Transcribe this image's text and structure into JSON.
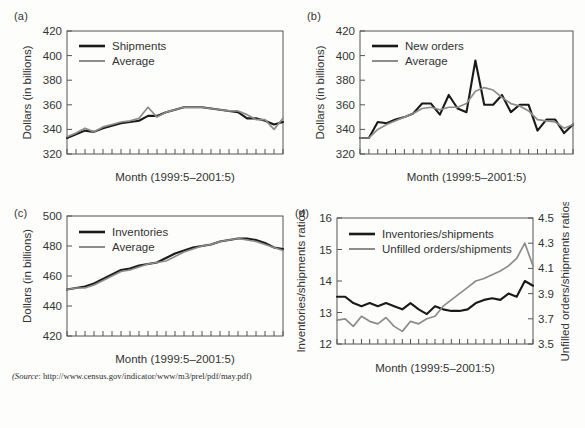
{
  "figure": {
    "source_prefix": "(Source",
    "source_text": ": http://www.census.gov/indicator/www/m3/prel/pdf/may.pdf)",
    "colors": {
      "primary": "#1a1a1a",
      "secondary": "#8c8c8c",
      "axis": "#555555",
      "background": "#fdfdfc"
    }
  },
  "panels": [
    {
      "id": "a",
      "label": "(a)"
    },
    {
      "id": "b",
      "label": "(b)"
    },
    {
      "id": "c",
      "label": "(c)"
    },
    {
      "id": "d",
      "label": "(d)"
    }
  ],
  "chart_data": [
    {
      "type": "line",
      "panel": "(a)",
      "title": "",
      "xlabel": "Month (1999:5–2001:5)",
      "ylabel": "Dollars (in billions)",
      "ylim": [
        320,
        420
      ],
      "yticks": [
        320,
        340,
        360,
        380,
        400,
        420
      ],
      "ytick_labels": [
        "320",
        "340",
        "360",
        "380",
        "400",
        "420"
      ],
      "grid": false,
      "legend_position": "upper-left",
      "n_points": 25,
      "x": [
        1,
        2,
        3,
        4,
        5,
        6,
        7,
        8,
        9,
        10,
        11,
        12,
        13,
        14,
        15,
        16,
        17,
        18,
        19,
        20,
        21,
        22,
        23,
        24,
        25
      ],
      "series": [
        {
          "name": "Shipments",
          "color": "#1a1a1a",
          "values": [
            333,
            336,
            339,
            338,
            341,
            343,
            345,
            346,
            347,
            351,
            351,
            354,
            356,
            358,
            358,
            358,
            357,
            356,
            355,
            354,
            349,
            349,
            347,
            344,
            346
          ]
        },
        {
          "name": "Average",
          "color": "#8c8c8c",
          "values": [
            334,
            337,
            341,
            338,
            342,
            344,
            346,
            347,
            349,
            358,
            350,
            354,
            356,
            358,
            358,
            358,
            357,
            356,
            355,
            355,
            352,
            348,
            348,
            340,
            349
          ]
        }
      ]
    },
    {
      "type": "line",
      "panel": "(b)",
      "title": "",
      "xlabel": "Month (1999:5–2001:5)",
      "ylabel": "Dollars (in billions)",
      "ylim": [
        320,
        420
      ],
      "yticks": [
        320,
        340,
        360,
        380,
        400,
        420
      ],
      "ytick_labels": [
        "320",
        "340",
        "360",
        "380",
        "400",
        "420"
      ],
      "grid": false,
      "legend_position": "upper-left",
      "n_points": 25,
      "x": [
        1,
        2,
        3,
        4,
        5,
        6,
        7,
        8,
        9,
        10,
        11,
        12,
        13,
        14,
        15,
        16,
        17,
        18,
        19,
        20,
        21,
        22,
        23,
        24,
        25
      ],
      "series": [
        {
          "name": "New orders",
          "color": "#1a1a1a",
          "values": [
            333,
            333,
            346,
            345,
            348,
            350,
            353,
            361,
            361,
            352,
            368,
            357,
            354,
            396,
            360,
            360,
            368,
            354,
            360,
            360,
            339,
            348,
            348,
            337,
            344
          ]
        },
        {
          "name": "Average",
          "color": "#8c8c8c",
          "values": [
            333,
            333,
            340,
            344,
            347,
            350,
            353,
            357,
            358,
            356,
            358,
            358,
            361,
            371,
            374,
            372,
            366,
            361,
            359,
            355,
            348,
            347,
            346,
            341,
            344
          ]
        }
      ]
    },
    {
      "type": "line",
      "panel": "(c)",
      "title": "",
      "xlabel": "Month (1999:5–2001:5)",
      "ylabel": "Dollars (in billions)",
      "ylim": [
        420,
        500
      ],
      "yticks": [
        420,
        440,
        460,
        480,
        500
      ],
      "ytick_labels": [
        "420",
        "440",
        "460",
        "480",
        "500"
      ],
      "grid": false,
      "legend_position": "upper-left",
      "n_points": 25,
      "x": [
        1,
        2,
        3,
        4,
        5,
        6,
        7,
        8,
        9,
        10,
        11,
        12,
        13,
        14,
        15,
        16,
        17,
        18,
        19,
        20,
        21,
        22,
        23,
        24,
        25
      ],
      "series": [
        {
          "name": "Inventories",
          "color": "#1a1a1a",
          "values": [
            451,
            452,
            453,
            455,
            458,
            461,
            464,
            465,
            467,
            468,
            469,
            472,
            475,
            477,
            479,
            480,
            481,
            483,
            484,
            485,
            485,
            484,
            482,
            479,
            478
          ]
        },
        {
          "name": "Average",
          "color": "#8c8c8c",
          "values": [
            451,
            452,
            452,
            454,
            457,
            460,
            463,
            464,
            466,
            468,
            469,
            470,
            473,
            476,
            478,
            480,
            481,
            483,
            484,
            485,
            484,
            483,
            481,
            479,
            477
          ]
        }
      ]
    },
    {
      "type": "line",
      "panel": "(d)",
      "title": "",
      "xlabel": "Month (1999:5–2001:5)",
      "ylabel": "Inventories/shipments ratios",
      "ylabel_right": "Unfilled orders/shipments ratios",
      "ylim": [
        12,
        16
      ],
      "yticks": [
        12,
        13,
        14,
        15,
        16
      ],
      "ytick_labels": [
        "12",
        "13",
        "14",
        "15",
        "16"
      ],
      "ylim_right": [
        3.5,
        4.5
      ],
      "yticks_right": [
        3.5,
        3.7,
        3.9,
        4.1,
        4.3,
        4.5
      ],
      "ytick_labels_right": [
        "3.5",
        "3.7",
        "3.9",
        "4.1",
        "4.3",
        "4.5"
      ],
      "grid": false,
      "legend_position": "upper-left",
      "n_points": 25,
      "x": [
        1,
        2,
        3,
        4,
        5,
        6,
        7,
        8,
        9,
        10,
        11,
        12,
        13,
        14,
        15,
        16,
        17,
        18,
        19,
        20,
        21,
        22,
        23,
        24,
        25
      ],
      "series": [
        {
          "name": "Inventories/shipments",
          "color": "#1a1a1a",
          "axis": "left",
          "values": [
            13.5,
            13.5,
            13.3,
            13.2,
            13.3,
            13.2,
            13.3,
            13.2,
            13.1,
            13.3,
            13.1,
            12.95,
            13.2,
            13.1,
            13.05,
            13.05,
            13.1,
            13.3,
            13.4,
            13.45,
            13.4,
            13.6,
            13.5,
            14.0,
            13.85
          ]
        },
        {
          "name": "Unfilled orders/shipments",
          "color": "#8c8c8c",
          "axis": "right",
          "values": [
            3.69,
            3.7,
            3.64,
            3.72,
            3.68,
            3.66,
            3.71,
            3.64,
            3.6,
            3.68,
            3.66,
            3.7,
            3.72,
            3.8,
            3.85,
            3.9,
            3.95,
            4.0,
            4.02,
            4.05,
            4.08,
            4.12,
            4.18,
            4.3,
            4.12
          ]
        }
      ]
    }
  ]
}
